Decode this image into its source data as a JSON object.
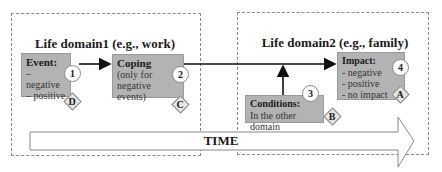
{
  "domains": [
    {
      "title": "Life domain1 (e.g., work)"
    },
    {
      "title": "Life domain2 (e.g., family)"
    }
  ],
  "nodes": {
    "event": {
      "title": "Event:",
      "lines": [
        "– negative",
        "– positive"
      ],
      "number": "1",
      "tag": "D"
    },
    "coping": {
      "title": "Coping",
      "lines": [
        "(only for",
        "negative events)"
      ],
      "number": "2",
      "tag": "C"
    },
    "conditions": {
      "title": "Conditions:",
      "lines": [
        "In the other domain"
      ],
      "number": "3",
      "tag": "B"
    },
    "impact": {
      "title": "Impact:",
      "lines": [
        "- negative",
        "- positive",
        "- no impact"
      ],
      "number": "4",
      "tag": "A"
    }
  },
  "timeline": {
    "label": "TIME"
  },
  "colors": {
    "node_fill": "#b3b3b3",
    "diamond_fill": "#e4e4e4",
    "border": "#8a8a8a",
    "arrow": "#111111"
  }
}
